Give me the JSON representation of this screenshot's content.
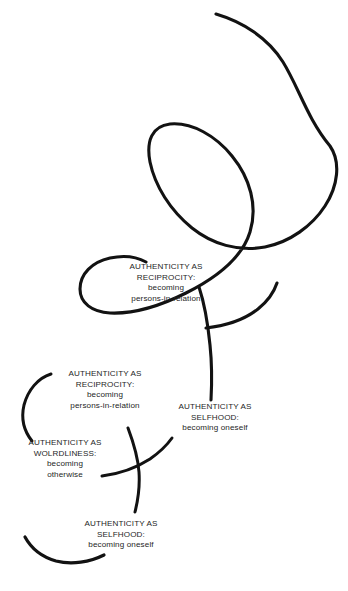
{
  "figure": {
    "background_color": "#ffffff",
    "line_color": "#121212",
    "text_color": "#262626"
  },
  "labels": [
    {
      "id": "reciprocity-upper",
      "line1": "AUTHENTICITY AS",
      "line2": "RECIPROCITY:",
      "line3": "becoming",
      "line4": "persons-in-relation"
    },
    {
      "id": "reciprocity-lower",
      "line1": "AUTHENTICITY AS",
      "line2": "RECIPROCITY:",
      "line3": "becoming",
      "line4": "persons-in-relation"
    },
    {
      "id": "selfhood-right",
      "line1": "AUTHENTICITY AS",
      "line2": "SELFHOOD:",
      "line3": "becoming oneself",
      "line4": ""
    },
    {
      "id": "worldliness",
      "line1": "AUTHENTICITY AS",
      "line2": "WOLRDLINESS:",
      "line3": "becoming",
      "line4": "otherwise"
    },
    {
      "id": "selfhood-bottom",
      "line1": "AUTHENTICITY AS",
      "line2": "SELFHOOD:",
      "line3": "becoming oneself",
      "line4": ""
    }
  ],
  "strokes": {
    "main_spiral_name": "spiral-curve",
    "left_arc_name": "left-arc",
    "cross_stroke_name": "cross-stroke",
    "bottom_arc_name": "bottom-arc"
  }
}
